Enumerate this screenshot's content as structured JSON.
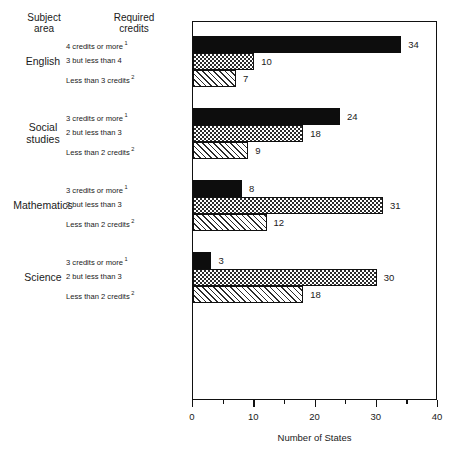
{
  "headers": {
    "subject_area": "Subject\narea",
    "subject_area_line1": "Subject",
    "subject_area_line2": "area",
    "required_credits_line1": "Required",
    "required_credits_line2": "credits"
  },
  "axis": {
    "title": "Number of States",
    "ticks": [
      "0",
      "10",
      "20",
      "30",
      "40"
    ]
  },
  "chart_data": {
    "type": "bar",
    "orientation": "horizontal",
    "title": "",
    "xlabel": "Number of States",
    "ylabel": "",
    "xlim": [
      0,
      40
    ],
    "xticks": [
      0,
      10,
      20,
      30,
      40
    ],
    "xminorticks": [
      5,
      15,
      25,
      35
    ],
    "grid": false,
    "legend": "none",
    "groups": [
      {
        "subject": "English",
        "subject_line1": "English",
        "subject_line2": "",
        "bars": [
          {
            "label": "4 credits or more",
            "footnote": "1",
            "value": 34,
            "value_text": "34",
            "fill": "solid"
          },
          {
            "label": "3 but less than 4",
            "footnote": "",
            "value": 10,
            "value_text": "10",
            "fill": "cross"
          },
          {
            "label": "Less than 3 credits",
            "footnote": "2",
            "value": 7,
            "value_text": "7",
            "fill": "diag"
          }
        ]
      },
      {
        "subject": "Social studies",
        "subject_line1": "Social",
        "subject_line2": "studies",
        "bars": [
          {
            "label": "3 credits or more",
            "footnote": "1",
            "value": 24,
            "value_text": "24",
            "fill": "solid"
          },
          {
            "label": "2 but less than 3",
            "footnote": "",
            "value": 18,
            "value_text": "18",
            "fill": "cross"
          },
          {
            "label": "Less than 2 credits",
            "footnote": "2",
            "value": 9,
            "value_text": "9",
            "fill": "diag"
          }
        ]
      },
      {
        "subject": "Mathematics",
        "subject_line1": "Mathematics",
        "subject_line2": "",
        "bars": [
          {
            "label": "3 credits or more",
            "footnote": "1",
            "value": 8,
            "value_text": "8",
            "fill": "solid"
          },
          {
            "label": "2 but less than 3",
            "footnote": "",
            "value": 31,
            "value_text": "31",
            "fill": "cross"
          },
          {
            "label": "Less than 2 credits",
            "footnote": "2",
            "value": 12,
            "value_text": "12",
            "fill": "diag"
          }
        ]
      },
      {
        "subject": "Science",
        "subject_line1": "Science",
        "subject_line2": "",
        "bars": [
          {
            "label": "3 credits or more",
            "footnote": "1",
            "value": 3,
            "value_text": "3",
            "fill": "solid"
          },
          {
            "label": "2 but less than 3",
            "footnote": "",
            "value": 30,
            "value_text": "30",
            "fill": "cross"
          },
          {
            "label": "Less than 2 credits",
            "footnote": "2",
            "value": 18,
            "value_text": "18",
            "fill": "diag"
          }
        ]
      }
    ]
  }
}
